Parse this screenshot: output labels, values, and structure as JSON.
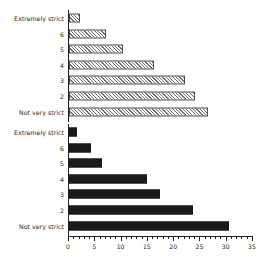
{
  "chart_data": [
    {
      "type": "bar",
      "orientation": "horizontal",
      "panel": "top",
      "title": "",
      "xlabel": "",
      "ylabel": "",
      "xlim": [
        0,
        35
      ],
      "xticks": [
        0,
        5,
        10,
        15,
        20,
        25,
        30,
        35
      ],
      "minor_tick_step": 1,
      "grid": false,
      "legend": false,
      "bar_style": "hatched",
      "bar_fill": "#ffffff",
      "bar_edge": "#4d4d4d",
      "categories": [
        "Extremely strict",
        "6",
        "5",
        "4",
        "3",
        "2",
        "Not very strict"
      ],
      "values": [
        2.0,
        7.0,
        10.2,
        16.2,
        22.0,
        24.0,
        26.5
      ]
    },
    {
      "type": "bar",
      "orientation": "horizontal",
      "panel": "bottom",
      "title": "",
      "xlabel": "",
      "ylabel": "",
      "xlim": [
        0,
        35
      ],
      "xticks": [
        0,
        5,
        10,
        15,
        20,
        25,
        30,
        35
      ],
      "minor_tick_step": 1,
      "grid": false,
      "legend": false,
      "bar_style": "solid",
      "bar_fill": "#1a1a1a",
      "bar_edge": "#1a1a1a",
      "categories": [
        "Extremely strict",
        "6",
        "5",
        "4",
        "3",
        "2",
        "Not very strict"
      ],
      "values": [
        1.6,
        4.1,
        6.2,
        14.8,
        17.4,
        23.6,
        30.4
      ]
    }
  ],
  "axis": {
    "tick_labels": [
      "0",
      "5",
      "10",
      "15",
      "20",
      "25",
      "30",
      "35"
    ]
  }
}
